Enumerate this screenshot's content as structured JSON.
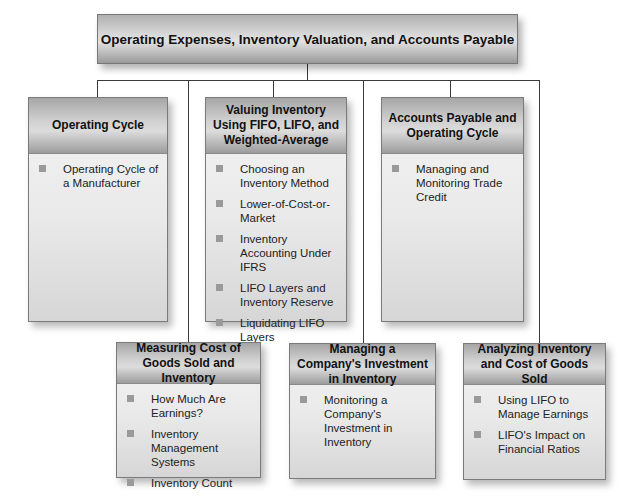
{
  "diagram": {
    "root": {
      "title": "Operating Expenses, Inventory Valuation, and Accounts Payable"
    },
    "sections": [
      {
        "title": "Operating Cycle",
        "items": [
          "Operating Cycle of a Manufacturer"
        ]
      },
      {
        "title": "Valuing Inventory Using FIFO, LIFO, and Weighted-Average",
        "items": [
          "Choosing an Inventory Method",
          "Lower-of-Cost-or-Market",
          "Inventory Accounting Under IFRS",
          "LIFO Layers and Inventory Reserve",
          "Liquidating LIFO Layers"
        ]
      },
      {
        "title": "Accounts Payable and Operating Cycle",
        "items": [
          "Managing and Monitoring Trade Credit"
        ]
      },
      {
        "title": "Measuring Cost of Goods Sold and Inventory",
        "items": [
          "How Much Are Earnings?",
          "Inventory Management Systems",
          "Inventory Count"
        ]
      },
      {
        "title": "Managing a Company's Investment in Inventory",
        "items": [
          "Monitoring a Company's Investment in Inventory"
        ]
      },
      {
        "title": "Analyzing Inventory and Cost of Goods Sold",
        "items": [
          "Using LIFO to Manage Earnings",
          "LIFO's Impact on Financial Ratios"
        ]
      }
    ]
  }
}
